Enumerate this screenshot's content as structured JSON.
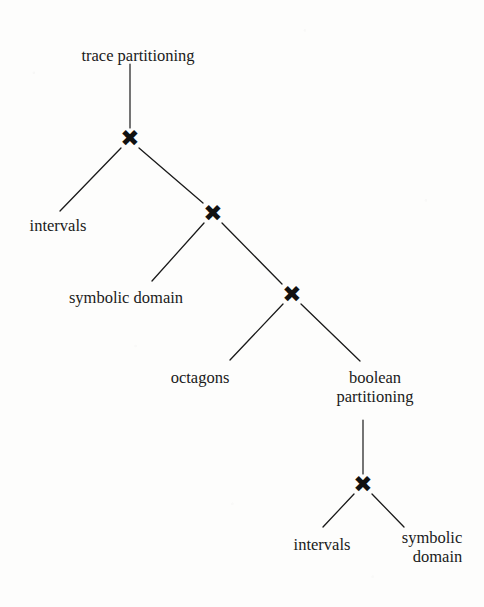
{
  "diagram": {
    "background_color": "#fdfdfc",
    "ink_color": "#1a1a1a",
    "operator_glyph": "✖",
    "nodes": [
      {
        "id": "root",
        "label": "trace partitioning",
        "x": 138,
        "y": 46,
        "align": "center",
        "kind": "leaf-label"
      },
      {
        "id": "x1",
        "label": "✖",
        "x": 130,
        "y": 138,
        "align": "center",
        "kind": "operator"
      },
      {
        "id": "intervals-1",
        "label": "intervals",
        "x": 58,
        "y": 216,
        "align": "center",
        "kind": "leaf-label"
      },
      {
        "id": "x2",
        "label": "✖",
        "x": 213,
        "y": 213,
        "align": "center",
        "kind": "operator"
      },
      {
        "id": "symbolic-1",
        "label": "symbolic domain",
        "x": 126,
        "y": 288,
        "align": "center",
        "kind": "leaf-label"
      },
      {
        "id": "x3",
        "label": "✖",
        "x": 292,
        "y": 294,
        "align": "center",
        "kind": "operator"
      },
      {
        "id": "octagons",
        "label": "octagons",
        "x": 200,
        "y": 368,
        "align": "center",
        "kind": "leaf-label"
      },
      {
        "id": "boolean",
        "label": "boolean\npartitioning",
        "x": 375,
        "y": 368,
        "align": "center",
        "kind": "leaf-label"
      },
      {
        "id": "x4",
        "label": "✖",
        "x": 363,
        "y": 484,
        "align": "center",
        "kind": "operator"
      },
      {
        "id": "intervals-2",
        "label": "intervals",
        "x": 322,
        "y": 535,
        "align": "center",
        "kind": "leaf-label"
      },
      {
        "id": "symbolic-2",
        "label": "symbolic\ndomain",
        "x": 432,
        "y": 528,
        "align": "right",
        "kind": "leaf-label"
      }
    ],
    "edges": [
      {
        "from": "root",
        "to": "x1",
        "x1": 130,
        "y1": 64,
        "x2": 130,
        "y2": 128,
        "kind": "vertical"
      },
      {
        "from": "x1",
        "to": "intervals-1",
        "x1": 121,
        "y1": 148,
        "x2": 60,
        "y2": 211,
        "kind": "diagonal"
      },
      {
        "from": "x1",
        "to": "x2",
        "x1": 139,
        "y1": 148,
        "x2": 203,
        "y2": 203,
        "kind": "diagonal"
      },
      {
        "from": "x2",
        "to": "symbolic-1",
        "x1": 204,
        "y1": 223,
        "x2": 152,
        "y2": 281,
        "kind": "diagonal"
      },
      {
        "from": "x2",
        "to": "x3",
        "x1": 222,
        "y1": 223,
        "x2": 282,
        "y2": 284,
        "kind": "diagonal"
      },
      {
        "from": "x3",
        "to": "octagons",
        "x1": 283,
        "y1": 304,
        "x2": 230,
        "y2": 360,
        "kind": "diagonal"
      },
      {
        "from": "x3",
        "to": "boolean",
        "x1": 301,
        "y1": 304,
        "x2": 360,
        "y2": 361,
        "kind": "diagonal"
      },
      {
        "from": "boolean",
        "to": "x4",
        "x1": 363,
        "y1": 420,
        "x2": 363,
        "y2": 474,
        "kind": "vertical"
      },
      {
        "from": "x4",
        "to": "intervals-2",
        "x1": 354,
        "y1": 494,
        "x2": 323,
        "y2": 527,
        "kind": "diagonal"
      },
      {
        "from": "x4",
        "to": "symbolic-2",
        "x1": 372,
        "y1": 494,
        "x2": 404,
        "y2": 527,
        "kind": "diagonal"
      }
    ]
  }
}
